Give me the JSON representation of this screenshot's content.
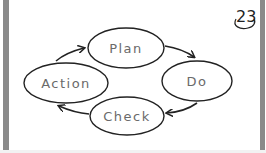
{
  "page": {
    "number": "23"
  },
  "diagram": {
    "type": "cycle",
    "nodes": [
      {
        "id": "plan",
        "label": "Plan"
      },
      {
        "id": "do",
        "label": "Do"
      },
      {
        "id": "check",
        "label": "Check"
      },
      {
        "id": "action",
        "label": "Action"
      }
    ],
    "edges": [
      {
        "from": "plan",
        "to": "do"
      },
      {
        "from": "do",
        "to": "check"
      },
      {
        "from": "check",
        "to": "action"
      },
      {
        "from": "action",
        "to": "plan"
      }
    ],
    "colors": {
      "stroke": "#222222",
      "label": "#6a6a6a",
      "frame": "#8a8a8a"
    }
  }
}
